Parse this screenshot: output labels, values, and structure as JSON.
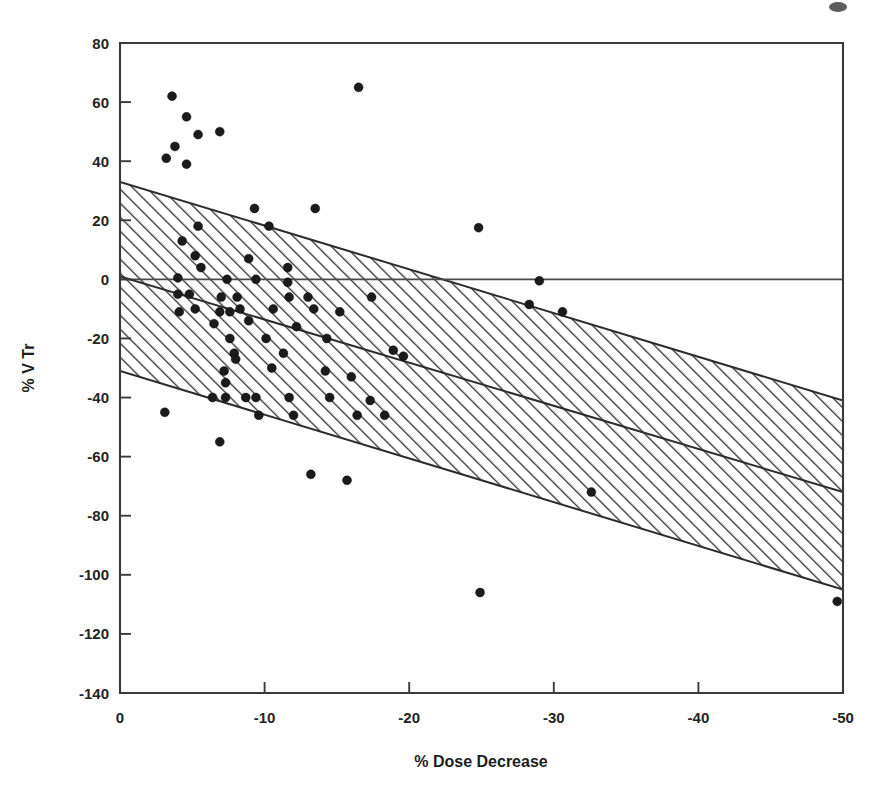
{
  "figure": {
    "background_color": "#ffffff",
    "ink_color": "#1b1b1b",
    "artifact_label": "scan-smudge"
  },
  "chart_data": {
    "type": "scatter",
    "title": "",
    "xlabel": "% Dose Decrease",
    "ylabel": "% V Tr",
    "xlim": [
      0,
      -50
    ],
    "ylim": [
      -140,
      80
    ],
    "x_ticks": [
      0,
      -10,
      -20,
      -30,
      -40,
      -50
    ],
    "x_tick_labels": [
      "0",
      "-10",
      "-20",
      "-30",
      "-40",
      "-50"
    ],
    "y_ticks": [
      80,
      60,
      40,
      20,
      0,
      -20,
      -40,
      -60,
      -80,
      -100,
      -120,
      -140
    ],
    "y_tick_labels": [
      "80",
      "60",
      "40",
      "20",
      "0",
      "-20",
      "-40",
      "-60",
      "-80",
      "-100",
      "-120",
      "-140"
    ],
    "grid": false,
    "legend": null,
    "marker": "filled-circle",
    "marker_size_px": 9,
    "reference_line": {
      "name": "zero-reference-line",
      "orientation": "horizontal",
      "y": 0
    },
    "regression_line": {
      "name": "regression-fit-line",
      "x_start": 0,
      "y_start": 1,
      "x_end": -50,
      "y_end": -72
    },
    "confidence_band": {
      "name": "prediction-interval-band",
      "fill": "diagonal-hatch",
      "hatch_angle_deg": 45,
      "hatch_spacing_px": 7,
      "upper_y_start": 33,
      "upper_y_end": -41,
      "lower_y_start": -31,
      "lower_y_end": -105
    },
    "points": [
      [
        -3.6,
        62
      ],
      [
        -4.6,
        55
      ],
      [
        -5.4,
        49
      ],
      [
        -6.9,
        50
      ],
      [
        -3.8,
        45
      ],
      [
        -3.2,
        41
      ],
      [
        -4.6,
        39
      ],
      [
        -16.5,
        65
      ],
      [
        -9.3,
        24
      ],
      [
        -13.5,
        24
      ],
      [
        -10.3,
        18
      ],
      [
        -24.8,
        17.5
      ],
      [
        -5.4,
        18
      ],
      [
        -4.3,
        13
      ],
      [
        -5.2,
        8
      ],
      [
        -8.9,
        7
      ],
      [
        -5.6,
        4
      ],
      [
        -11.6,
        4
      ],
      [
        -4.0,
        0.5
      ],
      [
        -7.4,
        0
      ],
      [
        -9.4,
        0
      ],
      [
        -11.6,
        -1
      ],
      [
        -29.0,
        -0.5
      ],
      [
        -4.0,
        -5
      ],
      [
        -4.8,
        -5
      ],
      [
        -7.0,
        -6
      ],
      [
        -8.1,
        -6
      ],
      [
        -11.7,
        -6
      ],
      [
        -13.0,
        -6
      ],
      [
        -17.4,
        -6
      ],
      [
        -4.1,
        -11
      ],
      [
        -5.2,
        -10
      ],
      [
        -6.9,
        -11
      ],
      [
        -7.6,
        -11
      ],
      [
        -8.3,
        -10
      ],
      [
        -10.6,
        -10
      ],
      [
        -13.4,
        -10
      ],
      [
        -15.2,
        -11
      ],
      [
        -28.3,
        -8.5
      ],
      [
        -30.6,
        -11
      ],
      [
        -6.5,
        -15
      ],
      [
        -8.9,
        -14
      ],
      [
        -12.2,
        -16
      ],
      [
        -7.6,
        -20
      ],
      [
        -10.1,
        -20
      ],
      [
        -14.3,
        -20
      ],
      [
        -7.9,
        -25
      ],
      [
        -8.0,
        -27
      ],
      [
        -11.3,
        -25
      ],
      [
        -18.9,
        -24
      ],
      [
        -19.6,
        -26
      ],
      [
        -7.2,
        -31
      ],
      [
        -10.5,
        -30
      ],
      [
        -14.2,
        -31
      ],
      [
        -7.3,
        -35
      ],
      [
        -16.0,
        -33
      ],
      [
        -6.4,
        -40
      ],
      [
        -7.3,
        -40
      ],
      [
        -8.7,
        -40
      ],
      [
        -9.4,
        -40
      ],
      [
        -11.7,
        -40
      ],
      [
        -14.5,
        -40
      ],
      [
        -17.3,
        -41
      ],
      [
        -9.6,
        -46
      ],
      [
        -12.0,
        -46
      ],
      [
        -16.4,
        -46
      ],
      [
        -18.3,
        -46
      ],
      [
        -3.1,
        -45
      ],
      [
        -6.9,
        -55
      ],
      [
        -13.2,
        -66
      ],
      [
        -15.7,
        -68
      ],
      [
        -32.6,
        -72
      ],
      [
        -24.9,
        -106
      ],
      [
        -49.6,
        -109
      ]
    ]
  }
}
